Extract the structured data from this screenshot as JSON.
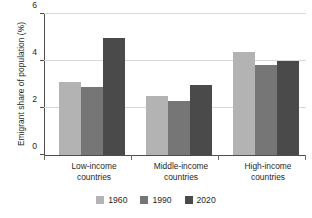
{
  "chart_data": {
    "type": "bar",
    "title": "",
    "subtitle": "",
    "xlabel": "",
    "ylabel": "Emigrant share of population (%)",
    "categories": [
      "Low-income countries",
      "Middle-income countries",
      "High-income countries"
    ],
    "category_lines": [
      [
        "Low-income",
        "countries"
      ],
      [
        "Middle-income",
        "countries"
      ],
      [
        "High-income",
        "countries"
      ]
    ],
    "series": [
      {
        "name": "1960",
        "color": "#b3b3b3",
        "values": [
          3.1,
          2.5,
          4.4
        ]
      },
      {
        "name": "1990",
        "color": "#767676",
        "values": [
          2.9,
          2.3,
          3.85
        ]
      },
      {
        "name": "2020",
        "color": "#4a4a4a",
        "values": [
          5.0,
          3.0,
          4.0
        ]
      }
    ],
    "ylim": [
      0,
      6
    ],
    "yticks": [
      0,
      2,
      4,
      6
    ],
    "ytick_labels": [
      "0",
      "2",
      "4",
      "6"
    ],
    "grid": true,
    "grid_axis": "y",
    "legend": {
      "position": "bottom-center",
      "orientation": "horizontal",
      "entries": [
        "1960",
        "1990",
        "2020"
      ]
    },
    "background_color": "#ffffff",
    "axis_color": "#4d4d4d",
    "grid_color": "#d8d8d8"
  }
}
